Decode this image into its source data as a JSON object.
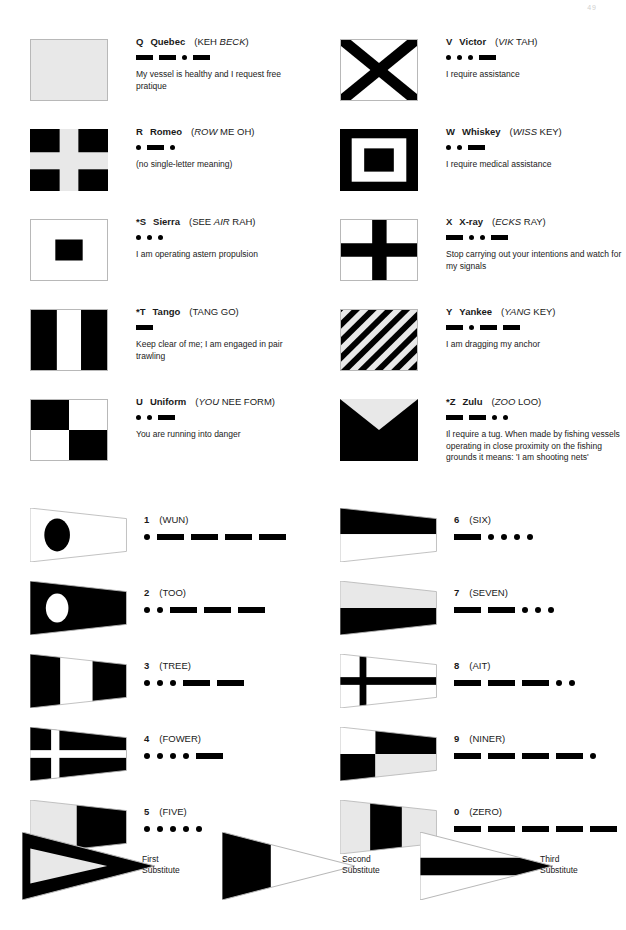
{
  "page": {
    "number": "49"
  },
  "letter_flags": [
    {
      "letter": "Q",
      "name": "Quebec",
      "pron_plain_1": "(KEH ",
      "pron_italic": "BECK",
      "pron_plain_2": ")",
      "morse": [
        "dash",
        "dash",
        "dot",
        "dash"
      ],
      "meaning": "My vessel is healthy and I request free pratique",
      "flag": "quebec",
      "framed": true
    },
    {
      "letter": "V",
      "name": "Victor",
      "pron_plain_1": "(",
      "pron_italic": "VIK",
      "pron_plain_2": " TAH)",
      "morse": [
        "dot",
        "dot",
        "dot",
        "dash"
      ],
      "meaning": "I require assistance",
      "flag": "victor",
      "framed": true
    },
    {
      "letter": "R",
      "name": "Romeo",
      "pron_plain_1": "(",
      "pron_italic": "ROW",
      "pron_plain_2": " ME OH)",
      "morse": [
        "dot",
        "dash",
        "dot"
      ],
      "meaning": "(no single-letter meaning)",
      "flag": "romeo",
      "framed": false
    },
    {
      "letter": "W",
      "name": "Whiskey",
      "pron_plain_1": "(",
      "pron_italic": "WISS",
      "pron_plain_2": " KEY)",
      "morse": [
        "dot",
        "dot",
        "dash"
      ],
      "meaning": "I require medical assistance",
      "flag": "whiskey",
      "framed": false
    },
    {
      "letter": "*S",
      "name": "Sierra",
      "pron_plain_1": "(SEE ",
      "pron_italic": "AIR",
      "pron_plain_2": " RAH)",
      "morse": [
        "dot",
        "dot",
        "dot"
      ],
      "meaning": "I am operating astern propulsion",
      "flag": "sierra",
      "framed": true
    },
    {
      "letter": "X",
      "name": "X-ray",
      "pron_plain_1": "(",
      "pron_italic": "ECKS",
      "pron_plain_2": " RAY)",
      "morse": [
        "dash",
        "dot",
        "dot",
        "dash"
      ],
      "meaning": "Stop carrying out your intentions and watch for my signals",
      "flag": "xray",
      "framed": true
    },
    {
      "letter": "*T",
      "name": "Tango",
      "pron_plain_1": "(TANG GO)",
      "pron_italic": "",
      "pron_plain_2": "",
      "morse": [
        "dash"
      ],
      "meaning": "Keep clear of me; I am engaged in pair trawling",
      "flag": "tango",
      "framed": true
    },
    {
      "letter": "Y",
      "name": "Yankee",
      "pron_plain_1": "(",
      "pron_italic": "YANG",
      "pron_plain_2": " KEY)",
      "morse": [
        "dash",
        "dot",
        "dash",
        "dash"
      ],
      "meaning": "I am dragging my anchor",
      "flag": "yankee",
      "framed": true
    },
    {
      "letter": "U",
      "name": "Uniform",
      "pron_plain_1": "(",
      "pron_italic": "YOU",
      "pron_plain_2": " NEE FORM)",
      "morse": [
        "dot",
        "dot",
        "dash"
      ],
      "meaning": "You are running into danger",
      "flag": "uniform",
      "framed": true
    },
    {
      "letter": "*Z",
      "name": "Zulu",
      "pron_plain_1": "(",
      "pron_italic": "ZOO",
      "pron_plain_2": " LOO)",
      "morse": [
        "dash",
        "dash",
        "dot",
        "dot"
      ],
      "meaning": "Il require a tug. When made by fishing vessels operating in close proximity on the fishing grounds it means: 'I am shooting nets'",
      "flag": "zulu",
      "framed": false
    }
  ],
  "numeral_pennants": [
    {
      "number": "1",
      "word": "(WUN)",
      "morse": [
        "dot",
        "dash",
        "dash",
        "dash",
        "dash"
      ],
      "pennant": "p1"
    },
    {
      "number": "6",
      "word": "(SIX)",
      "morse": [
        "dash",
        "dot",
        "dot",
        "dot",
        "dot"
      ],
      "pennant": "p6"
    },
    {
      "number": "2",
      "word": "(TOO)",
      "morse": [
        "dot",
        "dot",
        "dash",
        "dash",
        "dash"
      ],
      "pennant": "p2"
    },
    {
      "number": "7",
      "word": "(SEVEN)",
      "morse": [
        "dash",
        "dash",
        "dot",
        "dot",
        "dot"
      ],
      "pennant": "p7"
    },
    {
      "number": "3",
      "word": "(TREE)",
      "morse": [
        "dot",
        "dot",
        "dot",
        "dash",
        "dash"
      ],
      "pennant": "p3"
    },
    {
      "number": "8",
      "word": "(AIT)",
      "morse": [
        "dash",
        "dash",
        "dash",
        "dot",
        "dot"
      ],
      "pennant": "p8"
    },
    {
      "number": "4",
      "word": "(FOWER)",
      "morse": [
        "dot",
        "dot",
        "dot",
        "dot",
        "dash"
      ],
      "pennant": "p4"
    },
    {
      "number": "9",
      "word": "(NINER)",
      "morse": [
        "dash",
        "dash",
        "dash",
        "dash",
        "dot"
      ],
      "pennant": "p9"
    },
    {
      "number": "5",
      "word": "(FIVE)",
      "morse": [
        "dot",
        "dot",
        "dot",
        "dot",
        "dot"
      ],
      "pennant": "p5"
    },
    {
      "number": "0",
      "word": "(ZERO)",
      "morse": [
        "dash",
        "dash",
        "dash",
        "dash",
        "dash"
      ],
      "pennant": "p0"
    }
  ],
  "substitutes": [
    {
      "line1": "First",
      "line2": "Substitute",
      "shape": "sub1"
    },
    {
      "line1": "Second",
      "line2": "Substitute",
      "shape": "sub2"
    },
    {
      "line1": "Third",
      "line2": "Substitute",
      "shape": "sub3"
    }
  ],
  "colors": {
    "black": "#000000",
    "white": "#ffffff",
    "light_gray_fill": "#e8e8e8",
    "outline": "#b8b8b8"
  }
}
